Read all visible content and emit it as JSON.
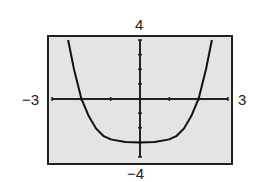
{
  "chart_data": {
    "type": "line",
    "title": "",
    "xlabel": "",
    "ylabel": "",
    "xlim": [
      -3,
      3
    ],
    "ylim": [
      -4,
      4
    ],
    "grid": false,
    "window_labels": {
      "xmin": "−3",
      "xmax": "3",
      "ymin": "−4",
      "ymax": "4"
    },
    "series": [
      {
        "name": "curve",
        "x": [
          -2.45,
          -2.25,
          -2.0,
          -1.75,
          -1.5,
          -1.25,
          -1.0,
          -0.5,
          0,
          0.5,
          1.0,
          1.25,
          1.5,
          1.75,
          2.0,
          2.25,
          2.45
        ],
        "y": [
          4.0,
          2.0,
          0.0,
          -1.2,
          -2.05,
          -2.55,
          -2.8,
          -2.98,
          -3.0,
          -2.98,
          -2.8,
          -2.55,
          -2.05,
          -1.2,
          0.0,
          2.0,
          4.0
        ]
      }
    ]
  },
  "labels": {
    "xmin": "−3",
    "xmax": "3",
    "ymin": "−4",
    "ymax": "4"
  },
  "colors": {
    "background": "#e4e4e4",
    "frame": "#222222",
    "curve": "#111111"
  }
}
